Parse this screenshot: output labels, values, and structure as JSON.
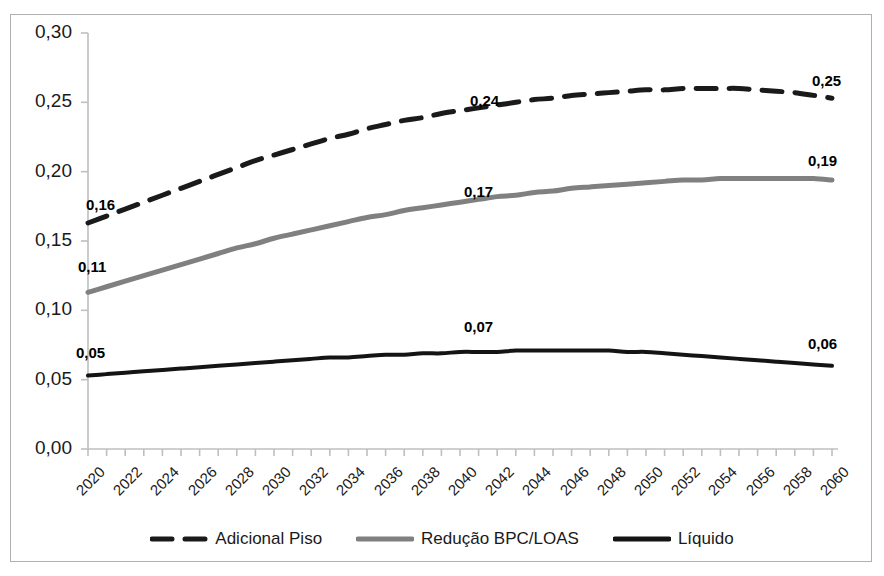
{
  "chart_data": {
    "type": "line",
    "title": "",
    "subtitle": "",
    "xlabel": "",
    "ylabel": "",
    "xlim": [
      2020,
      2060
    ],
    "ylim": [
      0.0,
      0.3
    ],
    "grid": false,
    "legend_position": "bottom",
    "y_ticks": [
      "0,00",
      "0,05",
      "0,10",
      "0,15",
      "0,20",
      "0,25",
      "0,30"
    ],
    "y_tick_values": [
      0.0,
      0.05,
      0.1,
      0.15,
      0.2,
      0.25,
      0.3
    ],
    "x_ticks": [
      "2020",
      "2022",
      "2024",
      "2026",
      "2028",
      "2030",
      "2032",
      "2034",
      "2036",
      "2038",
      "2040",
      "2042",
      "2044",
      "2046",
      "2048",
      "2050",
      "2052",
      "2054",
      "2056",
      "2058",
      "2060"
    ],
    "x_tick_values": [
      2020,
      2022,
      2024,
      2026,
      2028,
      2030,
      2032,
      2034,
      2036,
      2038,
      2040,
      2042,
      2044,
      2046,
      2048,
      2050,
      2052,
      2054,
      2056,
      2058,
      2060
    ],
    "x": [
      2020,
      2021,
      2022,
      2023,
      2024,
      2025,
      2026,
      2027,
      2028,
      2029,
      2030,
      2031,
      2032,
      2033,
      2034,
      2035,
      2036,
      2037,
      2038,
      2039,
      2040,
      2041,
      2042,
      2043,
      2044,
      2045,
      2046,
      2047,
      2048,
      2049,
      2050,
      2051,
      2052,
      2053,
      2054,
      2055,
      2056,
      2057,
      2058,
      2059,
      2060
    ],
    "series": [
      {
        "name": "Adicional Piso",
        "color": "#1a1a1a",
        "style": "dashed",
        "width": 5,
        "values": [
          0.163,
          0.168,
          0.173,
          0.178,
          0.183,
          0.188,
          0.193,
          0.198,
          0.203,
          0.208,
          0.212,
          0.216,
          0.22,
          0.224,
          0.227,
          0.231,
          0.234,
          0.237,
          0.239,
          0.242,
          0.244,
          0.246,
          0.248,
          0.25,
          0.252,
          0.253,
          0.255,
          0.256,
          0.257,
          0.258,
          0.259,
          0.259,
          0.26,
          0.26,
          0.26,
          0.26,
          0.259,
          0.258,
          0.257,
          0.255,
          0.253
        ]
      },
      {
        "name": "Redução BPC/LOAS",
        "color": "#808080",
        "style": "solid",
        "width": 5,
        "values": [
          0.113,
          0.117,
          0.121,
          0.125,
          0.129,
          0.133,
          0.137,
          0.141,
          0.145,
          0.148,
          0.152,
          0.155,
          0.158,
          0.161,
          0.164,
          0.167,
          0.169,
          0.172,
          0.174,
          0.176,
          0.178,
          0.18,
          0.182,
          0.183,
          0.185,
          0.186,
          0.188,
          0.189,
          0.19,
          0.191,
          0.192,
          0.193,
          0.194,
          0.194,
          0.195,
          0.195,
          0.195,
          0.195,
          0.195,
          0.195,
          0.194
        ]
      },
      {
        "name": "Líquido",
        "color": "#141414",
        "style": "solid",
        "width": 4,
        "values": [
          0.053,
          0.054,
          0.055,
          0.056,
          0.057,
          0.058,
          0.059,
          0.06,
          0.061,
          0.062,
          0.063,
          0.064,
          0.065,
          0.066,
          0.066,
          0.067,
          0.068,
          0.068,
          0.069,
          0.069,
          0.07,
          0.07,
          0.07,
          0.071,
          0.071,
          0.071,
          0.071,
          0.071,
          0.071,
          0.07,
          0.07,
          0.069,
          0.068,
          0.067,
          0.066,
          0.065,
          0.064,
          0.063,
          0.062,
          0.061,
          0.06
        ]
      }
    ],
    "annotations": [
      {
        "text": "0,16",
        "series": "Adicional Piso",
        "x": 2020,
        "value": 0.163,
        "px": 86,
        "py": 196
      },
      {
        "text": "0,24",
        "series": "Adicional Piso",
        "x": 2039,
        "value": 0.242,
        "px": 470,
        "py": 92
      },
      {
        "text": "0,25",
        "series": "Adicional Piso",
        "x": 2060,
        "value": 0.253,
        "px": 812,
        "py": 72
      },
      {
        "text": "0,11",
        "series": "Redução BPC/LOAS",
        "x": 2020,
        "value": 0.113,
        "px": 78,
        "py": 258
      },
      {
        "text": "0,17",
        "series": "Redução BPC/LOAS",
        "x": 2039,
        "value": 0.176,
        "px": 464,
        "py": 183
      },
      {
        "text": "0,19",
        "series": "Redução BPC/LOAS",
        "x": 2060,
        "value": 0.194,
        "px": 808,
        "py": 152
      },
      {
        "text": "0,05",
        "series": "Líquido",
        "x": 2020,
        "value": 0.053,
        "px": 76,
        "py": 344
      },
      {
        "text": "0,07",
        "series": "Líquido",
        "x": 2039,
        "value": 0.069,
        "px": 464,
        "py": 318
      },
      {
        "text": "0,06",
        "series": "Líquido",
        "x": 2060,
        "value": 0.06,
        "px": 808,
        "py": 335
      }
    ]
  },
  "legend": {
    "items": [
      {
        "label": "Adicional Piso",
        "color": "#1a1a1a",
        "style": "dashed"
      },
      {
        "label": "Redução BPC/LOAS",
        "color": "#808080",
        "style": "solid"
      },
      {
        "label": "Líquido",
        "color": "#141414",
        "style": "solid"
      }
    ]
  },
  "axes": {
    "y_axis_color": "#bfbfbf",
    "x_axis_color": "#bfbfbf",
    "plot_left_px": 88,
    "plot_right_px": 832,
    "plot_top_px": 33,
    "plot_bottom_px": 449
  },
  "frame": {
    "border_color": "#b0b0b0",
    "background": "#ffffff"
  }
}
